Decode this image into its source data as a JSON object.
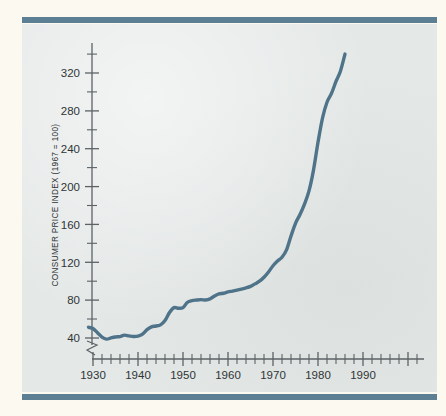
{
  "figure": {
    "background_color": "#fbf9f0",
    "panel_color": "#e4e8e7",
    "rule_color": "#5d7f93",
    "line_color": "#4f7489"
  },
  "chart_data": {
    "type": "line",
    "title": "",
    "subtitle": "",
    "xlabel": "",
    "ylabel": "CONSUMER PRICE INDEX (1967 = 100)",
    "xlim": [
      1928,
      1994
    ],
    "ylim": [
      33,
      345
    ],
    "grid": false,
    "legend": null,
    "y_axis_break": true,
    "y_break_note": "axis broken below 40",
    "x_major_ticks": [
      1930,
      1940,
      1950,
      1960,
      1970,
      1980,
      1990
    ],
    "x_major_tick_labels": [
      "1930",
      "1940",
      "1950",
      "1960",
      "1970",
      "1980",
      "1990"
    ],
    "x_minor_tick_interval": 2,
    "y_major_ticks": [
      40,
      80,
      120,
      160,
      200,
      240,
      280,
      320
    ],
    "y_major_tick_labels": [
      "40",
      "80",
      "120",
      "160",
      "200",
      "240",
      "280",
      "320"
    ],
    "y_minor_tick_interval": 20,
    "series": [
      {
        "name": "Consumer Price Index",
        "color": "#4f7489",
        "x": [
          1929,
          1930,
          1931,
          1932,
          1933,
          1934,
          1935,
          1936,
          1937,
          1938,
          1939,
          1940,
          1941,
          1942,
          1943,
          1944,
          1945,
          1946,
          1947,
          1948,
          1949,
          1950,
          1951,
          1952,
          1953,
          1954,
          1955,
          1956,
          1957,
          1958,
          1959,
          1960,
          1961,
          1962,
          1963,
          1964,
          1965,
          1966,
          1967,
          1968,
          1969,
          1970,
          1971,
          1972,
          1973,
          1974,
          1975,
          1976,
          1977,
          1978,
          1979,
          1980,
          1981,
          1982,
          1983,
          1984,
          1985,
          1986
        ],
        "values": [
          51.3,
          50.0,
          45.6,
          40.9,
          38.8,
          40.1,
          41.1,
          41.5,
          43.0,
          42.2,
          41.6,
          42.0,
          44.1,
          48.8,
          51.8,
          52.7,
          53.9,
          58.5,
          66.9,
          72.1,
          71.4,
          72.1,
          77.8,
          79.5,
          80.1,
          80.5,
          80.2,
          81.4,
          84.3,
          86.6,
          87.3,
          88.7,
          89.6,
          90.6,
          91.7,
          92.9,
          94.5,
          97.2,
          100.0,
          104.2,
          109.8,
          116.3,
          121.3,
          125.3,
          133.1,
          147.7,
          161.2,
          170.5,
          181.5,
          195.4,
          217.4,
          246.8,
          272.4,
          289.1,
          298.4,
          311.1,
          322.2,
          340.0
        ],
        "start_year": 1929,
        "end_year": 1986,
        "start_value": 51.3,
        "end_value": 340.0,
        "min_value": 38.8,
        "min_year": 1933,
        "max_value": 340.0,
        "max_year": 1986
      }
    ]
  }
}
